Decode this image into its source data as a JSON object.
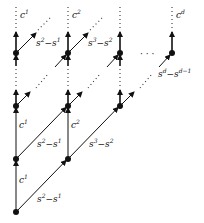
{
  "diagram": {
    "title": "",
    "nodes": [
      {
        "id": "r0c1",
        "x": 16,
        "y": 212
      },
      {
        "id": "r1c1",
        "x": 16,
        "y": 159
      },
      {
        "id": "r1c2",
        "x": 68,
        "y": 159
      },
      {
        "id": "r2c1",
        "x": 16,
        "y": 106
      },
      {
        "id": "r2c2",
        "x": 68,
        "y": 106
      },
      {
        "id": "r2c3",
        "x": 120,
        "y": 106
      },
      {
        "id": "top1",
        "x": 16,
        "y": 53
      },
      {
        "id": "top2",
        "x": 68,
        "y": 53
      },
      {
        "id": "top3",
        "x": 120,
        "y": 53
      },
      {
        "id": "topd",
        "x": 172,
        "y": 53
      }
    ],
    "labels": {
      "c1_top": {
        "base": "c",
        "sup": "1"
      },
      "c2_top": {
        "base": "c",
        "sup": "2"
      },
      "cd_top": {
        "base": "c",
        "sup": "d"
      },
      "s2s1_top": {
        "a": "s",
        "a_sup": "2",
        "op": "−",
        "b": "s",
        "b_sup": "1"
      },
      "s3s2_top": {
        "a": "s",
        "a_sup": "3",
        "op": "−",
        "b": "s",
        "b_sup": "2"
      },
      "sdsd1": {
        "a": "s",
        "a_sup": "d",
        "op": "−",
        "b": "s",
        "b_sup": "d−1"
      },
      "c1_mid": {
        "base": "c",
        "sup": "1"
      },
      "c2_mid": {
        "base": "c",
        "sup": "2"
      },
      "s2s1_mid": {
        "a": "s",
        "a_sup": "2",
        "op": "−",
        "b": "s",
        "b_sup": "1"
      },
      "s3s2_mid": {
        "a": "s",
        "a_sup": "3",
        "op": "−",
        "b": "s",
        "b_sup": "2"
      },
      "c1_low": {
        "base": "c",
        "sup": "1"
      },
      "s2s1_low": {
        "a": "s",
        "a_sup": "2",
        "op": "−",
        "b": "s",
        "b_sup": "1"
      }
    },
    "ellipsis": "· · ·"
  }
}
